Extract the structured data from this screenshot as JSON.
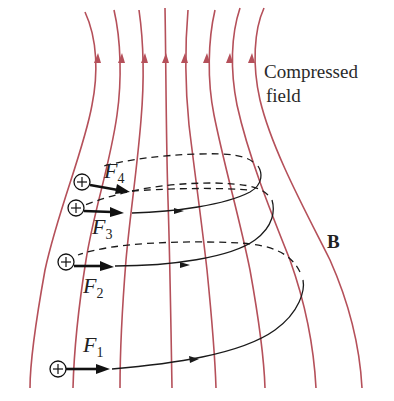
{
  "figure": {
    "labels": {
      "compressed_line1": "Compressed",
      "compressed_line2": "field",
      "field_symbol": "B"
    },
    "forces": [
      {
        "letter": "F",
        "subscript": "1"
      },
      {
        "letter": "F",
        "subscript": "2"
      },
      {
        "letter": "F",
        "subscript": "3"
      },
      {
        "letter": "F",
        "subscript": "4"
      }
    ],
    "charge_sign": "+",
    "field_line_count": 8,
    "field_direction": "upward",
    "colors": {
      "field_lines": "#b5505a",
      "trajectory": "#1a1a1a",
      "text": "#222222"
    }
  }
}
